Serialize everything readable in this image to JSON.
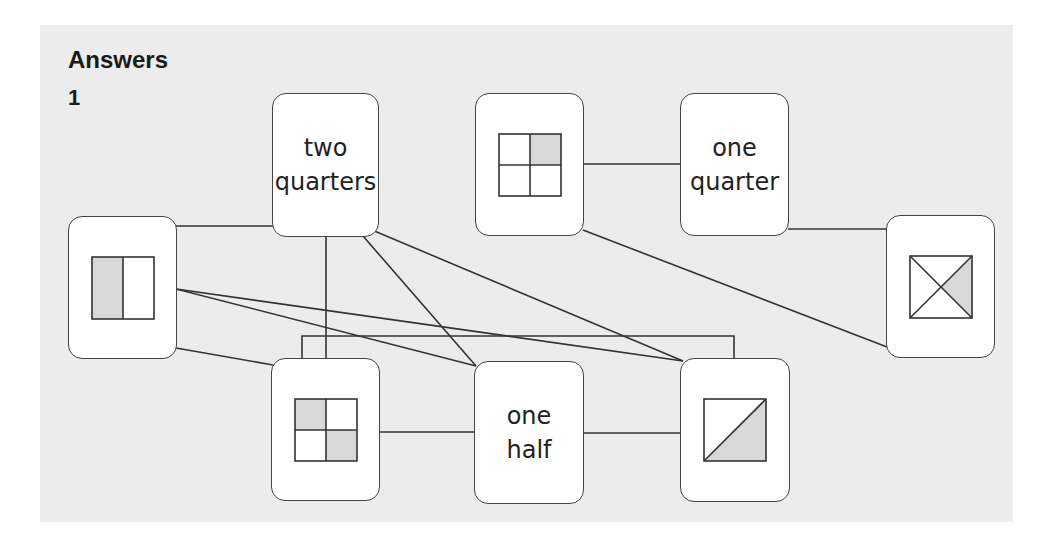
{
  "heading": "Answers",
  "question_number": "1",
  "colors": {
    "panel_bg": "#ececec",
    "card_bg": "#ffffff",
    "line": "#333333",
    "shade": "#d8d8d8"
  },
  "cards": {
    "two_quarters": {
      "label": "two\nquarters"
    },
    "quarter_picture": {
      "shape": "square-4-parts-top-right-shaded"
    },
    "one_quarter": {
      "label": "one\nquarter"
    },
    "halves_picture": {
      "shape": "square-2-vertical-parts-left-shaded"
    },
    "cross_picture": {
      "shape": "square-diagonals-right-triangle-shaded"
    },
    "two_quarters_picture": {
      "shape": "square-4-parts-diagonal-shaded"
    },
    "one_half": {
      "label": "one\nhalf"
    },
    "diagonal_picture": {
      "shape": "square-diagonal-bottom-right-shaded"
    }
  },
  "connections": [
    [
      "halves_picture",
      "two_quarters"
    ],
    [
      "halves_picture",
      "one_half"
    ],
    [
      "halves_picture",
      "diagonal_picture"
    ],
    [
      "halves_picture",
      "two_quarters_picture"
    ],
    [
      "two_quarters",
      "two_quarters_picture"
    ],
    [
      "two_quarters",
      "one_half"
    ],
    [
      "two_quarters",
      "diagonal_picture"
    ],
    [
      "quarter_picture",
      "one_quarter"
    ],
    [
      "quarter_picture",
      "cross_picture"
    ],
    [
      "one_quarter",
      "cross_picture"
    ],
    [
      "two_quarters_picture",
      "one_half"
    ],
    [
      "one_half",
      "diagonal_picture"
    ],
    [
      "two_quarters_picture",
      "diagonal_picture"
    ]
  ]
}
